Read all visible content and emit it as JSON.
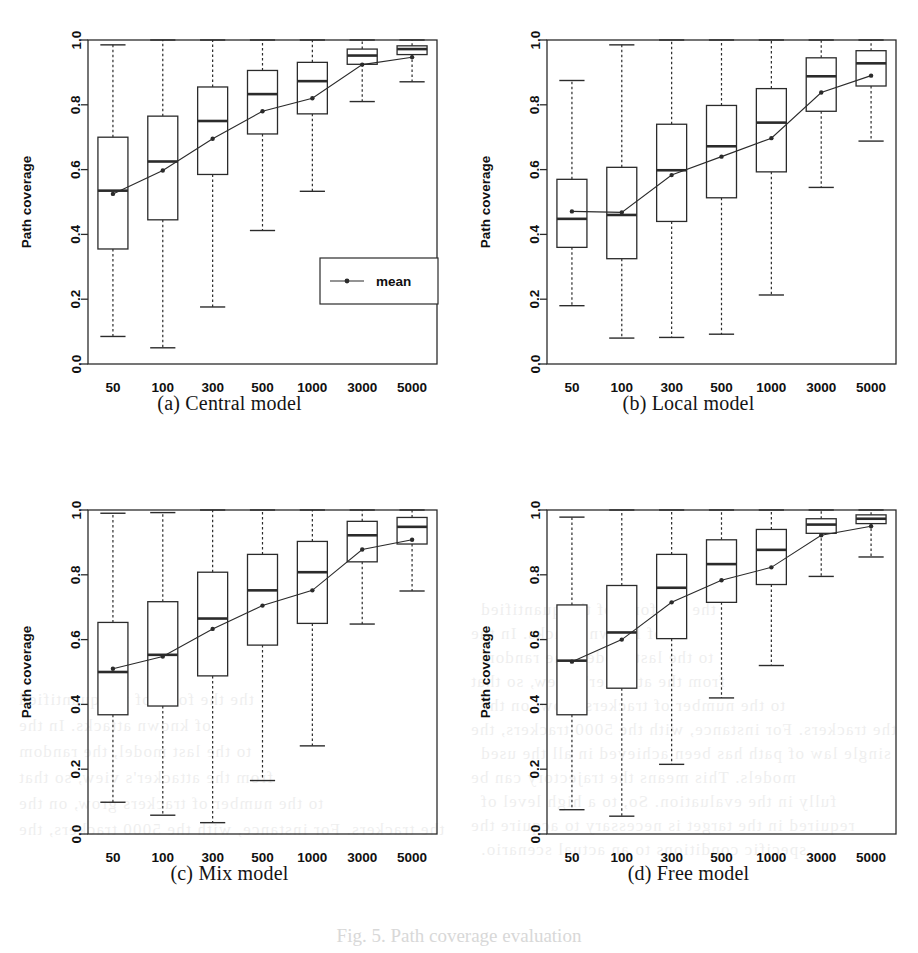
{
  "figure": {
    "caption": "Fig. 5. Path coverage evaluation",
    "panels": [
      {
        "key": "a",
        "caption": "(a) Central model"
      },
      {
        "key": "b",
        "caption": "(b) Local model"
      },
      {
        "key": "c",
        "caption": "(c) Mix model"
      },
      {
        "key": "d",
        "caption": "(d) Free model"
      }
    ]
  },
  "background_bleed": [
    "the the form of the quantified",
    "of known attacks. In the",
    "to the last model, the random",
    "from the attacker's view, so that",
    "to the number of trackers grow, on the",
    "the trackers. For instance, with the 5000 trackers, the",
    "single law of path has been achieved in all the used",
    "models. This means the trajectory can be",
    "fully in the evaluation. So, to a high level of",
    "required in the target is necessary to acquire the",
    "specific conditions to an actual scenario."
  ],
  "axes": {
    "x_label": "Number of trackers",
    "y_label": "Path coverage",
    "x_categories": [
      "50",
      "100",
      "300",
      "500",
      "1000",
      "3000",
      "5000"
    ],
    "y_ticks": [
      "0.0",
      "0.2",
      "0.4",
      "0.6",
      "0.8",
      "1.0"
    ],
    "y_min": 0.0,
    "y_max": 1.0
  },
  "legend": {
    "visible_in_panel": "a",
    "entries": [
      {
        "label": "mean",
        "marker": "line-with-point"
      }
    ]
  },
  "colors": {
    "line": "#2b2b2b",
    "box_stroke": "#2b2b2b",
    "box_fill": "#ffffff",
    "whisker": "#2b2b2b",
    "text": "#101010",
    "ghost": "#4b4b4b"
  },
  "chart_data": [
    {
      "id": "a",
      "type": "box",
      "title": "(a) Central model",
      "xlabel": "Number of trackers",
      "ylabel": "Path coverage",
      "ylim": [
        0.0,
        1.0
      ],
      "grid": false,
      "legend": "inside-lower-right",
      "categories": [
        "50",
        "100",
        "300",
        "500",
        "1000",
        "3000",
        "5000"
      ],
      "boxes": [
        {
          "category": "50",
          "whisker_low": 0.085,
          "q1": 0.355,
          "median": 0.535,
          "q3": 0.7,
          "whisker_high": 0.985,
          "mean": 0.525
        },
        {
          "category": "100",
          "whisker_low": 0.05,
          "q1": 0.445,
          "median": 0.625,
          "q3": 0.765,
          "whisker_high": 1.0,
          "mean": 0.597
        },
        {
          "category": "300",
          "whisker_low": 0.176,
          "q1": 0.585,
          "median": 0.75,
          "q3": 0.855,
          "whisker_high": 1.0,
          "mean": 0.695
        },
        {
          "category": "500",
          "whisker_low": 0.412,
          "q1": 0.71,
          "median": 0.833,
          "q3": 0.906,
          "whisker_high": 1.0,
          "mean": 0.78
        },
        {
          "category": "1000",
          "whisker_low": 0.533,
          "q1": 0.772,
          "median": 0.873,
          "q3": 0.931,
          "whisker_high": 1.0,
          "mean": 0.82
        },
        {
          "category": "3000",
          "whisker_low": 0.81,
          "q1": 0.925,
          "median": 0.952,
          "q3": 0.972,
          "whisker_high": 1.0,
          "mean": 0.924
        },
        {
          "category": "5000",
          "whisker_low": 0.871,
          "q1": 0.955,
          "median": 0.972,
          "q3": 0.982,
          "whisker_high": 1.0,
          "mean": 0.947
        }
      ],
      "series": [
        {
          "name": "mean",
          "values": [
            0.525,
            0.597,
            0.695,
            0.78,
            0.82,
            0.924,
            0.947
          ]
        }
      ]
    },
    {
      "id": "b",
      "type": "box",
      "title": "(b) Local model",
      "xlabel": "Number of trackers",
      "ylabel": "Path coverage",
      "ylim": [
        0.0,
        1.0
      ],
      "grid": false,
      "legend": "none",
      "categories": [
        "50",
        "100",
        "300",
        "500",
        "1000",
        "3000",
        "5000"
      ],
      "boxes": [
        {
          "category": "50",
          "whisker_low": 0.18,
          "q1": 0.36,
          "median": 0.448,
          "q3": 0.57,
          "whisker_high": 0.875,
          "mean": 0.471
        },
        {
          "category": "100",
          "whisker_low": 0.08,
          "q1": 0.325,
          "median": 0.46,
          "q3": 0.607,
          "whisker_high": 0.985,
          "mean": 0.468
        },
        {
          "category": "300",
          "whisker_low": 0.082,
          "q1": 0.44,
          "median": 0.598,
          "q3": 0.74,
          "whisker_high": 1.0,
          "mean": 0.583
        },
        {
          "category": "500",
          "whisker_low": 0.092,
          "q1": 0.513,
          "median": 0.672,
          "q3": 0.798,
          "whisker_high": 1.0,
          "mean": 0.64
        },
        {
          "category": "1000",
          "whisker_low": 0.213,
          "q1": 0.593,
          "median": 0.745,
          "q3": 0.85,
          "whisker_high": 1.0,
          "mean": 0.697
        },
        {
          "category": "3000",
          "whisker_low": 0.545,
          "q1": 0.78,
          "median": 0.888,
          "q3": 0.945,
          "whisker_high": 1.0,
          "mean": 0.838
        },
        {
          "category": "5000",
          "whisker_low": 0.688,
          "q1": 0.858,
          "median": 0.928,
          "q3": 0.967,
          "whisker_high": 1.0,
          "mean": 0.89
        }
      ],
      "series": [
        {
          "name": "mean",
          "values": [
            0.471,
            0.468,
            0.583,
            0.64,
            0.697,
            0.838,
            0.89
          ]
        }
      ]
    },
    {
      "id": "c",
      "type": "box",
      "title": "(c) Mix model",
      "xlabel": "Number of trackers",
      "ylabel": "Path coverage",
      "ylim": [
        0.0,
        1.0
      ],
      "grid": false,
      "legend": "none",
      "categories": [
        "50",
        "100",
        "300",
        "500",
        "1000",
        "3000",
        "5000"
      ],
      "boxes": [
        {
          "category": "50",
          "whisker_low": 0.098,
          "q1": 0.368,
          "median": 0.5,
          "q3": 0.653,
          "whisker_high": 0.99,
          "mean": 0.51
        },
        {
          "category": "100",
          "whisker_low": 0.058,
          "q1": 0.395,
          "median": 0.553,
          "q3": 0.717,
          "whisker_high": 0.992,
          "mean": 0.548
        },
        {
          "category": "300",
          "whisker_low": 0.035,
          "q1": 0.488,
          "median": 0.665,
          "q3": 0.808,
          "whisker_high": 1.0,
          "mean": 0.633
        },
        {
          "category": "500",
          "whisker_low": 0.165,
          "q1": 0.583,
          "median": 0.752,
          "q3": 0.863,
          "whisker_high": 1.0,
          "mean": 0.705
        },
        {
          "category": "1000",
          "whisker_low": 0.272,
          "q1": 0.65,
          "median": 0.808,
          "q3": 0.903,
          "whisker_high": 1.0,
          "mean": 0.752
        },
        {
          "category": "3000",
          "whisker_low": 0.648,
          "q1": 0.84,
          "median": 0.922,
          "q3": 0.965,
          "whisker_high": 1.0,
          "mean": 0.878
        },
        {
          "category": "5000",
          "whisker_low": 0.75,
          "q1": 0.895,
          "median": 0.948,
          "q3": 0.977,
          "whisker_high": 1.0,
          "mean": 0.908
        }
      ],
      "series": [
        {
          "name": "mean",
          "values": [
            0.51,
            0.548,
            0.633,
            0.705,
            0.752,
            0.878,
            0.908
          ]
        }
      ]
    },
    {
      "id": "d",
      "type": "box",
      "title": "(d) Free model",
      "xlabel": "Number of trackers",
      "ylabel": "Path coverage",
      "ylim": [
        0.0,
        1.0
      ],
      "grid": false,
      "legend": "none",
      "categories": [
        "50",
        "100",
        "300",
        "500",
        "1000",
        "3000",
        "5000"
      ],
      "boxes": [
        {
          "category": "50",
          "whisker_low": 0.075,
          "q1": 0.368,
          "median": 0.535,
          "q3": 0.707,
          "whisker_high": 0.978,
          "mean": 0.532
        },
        {
          "category": "100",
          "whisker_low": 0.055,
          "q1": 0.45,
          "median": 0.622,
          "q3": 0.767,
          "whisker_high": 1.0,
          "mean": 0.6
        },
        {
          "category": "300",
          "whisker_low": 0.215,
          "q1": 0.603,
          "median": 0.76,
          "q3": 0.863,
          "whisker_high": 1.0,
          "mean": 0.715
        },
        {
          "category": "500",
          "whisker_low": 0.42,
          "q1": 0.715,
          "median": 0.833,
          "q3": 0.908,
          "whisker_high": 1.0,
          "mean": 0.783
        },
        {
          "category": "1000",
          "whisker_low": 0.52,
          "q1": 0.77,
          "median": 0.877,
          "q3": 0.94,
          "whisker_high": 1.0,
          "mean": 0.823
        },
        {
          "category": "3000",
          "whisker_low": 0.795,
          "q1": 0.928,
          "median": 0.955,
          "q3": 0.973,
          "whisker_high": 1.0,
          "mean": 0.922
        },
        {
          "category": "5000",
          "whisker_low": 0.855,
          "q1": 0.958,
          "median": 0.973,
          "q3": 0.985,
          "whisker_high": 1.0,
          "mean": 0.95
        }
      ],
      "series": [
        {
          "name": "mean",
          "values": [
            0.532,
            0.6,
            0.715,
            0.783,
            0.823,
            0.922,
            0.95
          ]
        }
      ]
    }
  ]
}
